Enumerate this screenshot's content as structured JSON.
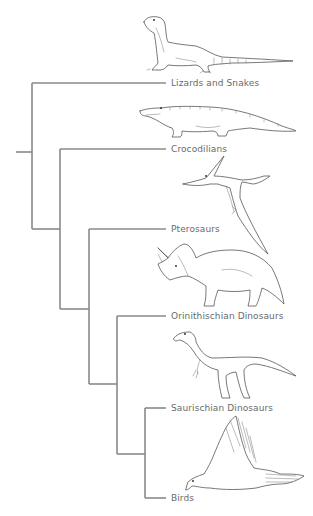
{
  "diagram": {
    "type": "cladogram",
    "line_color": "#8a8a8a",
    "text_color": "#6a6a6a",
    "taxa": [
      {
        "id": "lizards",
        "label": "Lizards and Snakes",
        "illustration": "monitor-lizard"
      },
      {
        "id": "crocs",
        "label": "Crocodilians",
        "illustration": "crocodile"
      },
      {
        "id": "pterosaurs",
        "label": "Pterosaurs",
        "illustration": "pteranodon"
      },
      {
        "id": "ornithischians",
        "label": "Orinithischian Dinosaurs",
        "illustration": "triceratops"
      },
      {
        "id": "saurischians",
        "label": "Saurischian Dinosaurs",
        "illustration": "theropod"
      },
      {
        "id": "birds",
        "label": "Birds",
        "illustration": "flying-bird"
      }
    ],
    "topology": "(Lizards and Snakes,(Crocodilians,(Pterosaurs,(Orinithischian Dinosaurs,(Saurischian Dinosaurs,Birds)))))"
  }
}
